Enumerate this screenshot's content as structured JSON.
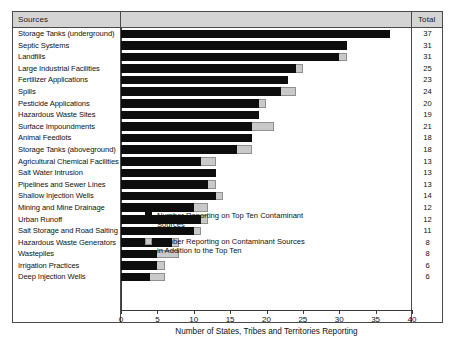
{
  "table": {
    "header": {
      "sources_label": "Sources",
      "total_label": "Total"
    }
  },
  "axis": {
    "title": "Number of States, Tribes and Territories Reporting",
    "ticks": [
      "0",
      "5",
      "10",
      "15",
      "20",
      "25",
      "30",
      "35",
      "40"
    ]
  },
  "legend": {
    "items": [
      {
        "label": "Number Reporting on Top Ten Contaminant Sources",
        "color": "#0d0d0d",
        "swatch": "primary"
      },
      {
        "label": "Number Reporting on Contaminant Sources in Addition to the Top Ten",
        "color": "#c9c9c9",
        "swatch": "secondary"
      }
    ]
  },
  "chart_data": {
    "type": "bar",
    "orientation": "horizontal",
    "stacked": true,
    "title": "",
    "xlabel": "Number of States, Tribes and Territories Reporting",
    "ylabel": "Sources",
    "xlim": [
      0,
      40
    ],
    "xticks": [
      0,
      5,
      10,
      15,
      20,
      25,
      30,
      35,
      40
    ],
    "grid": false,
    "legend_position": "inside-lower-center",
    "categories": [
      "Storage Tanks (underground)",
      "Septic Systems",
      "Landfills",
      "Large Industrial Facilities",
      "Fertilizer Applications",
      "Spills",
      "Pesticide Applications",
      "Hazardous Waste Sites",
      "Surface Impoundments",
      "Animal Feedlots",
      "Storage Tanks (aboveground)",
      "Agricultural Chemical Facilities",
      "Salt Water Intrusion",
      "Pipelines and Sewer Lines",
      "Shallow Injection Wells",
      "Mining and Mine Drainage",
      "Urban Runoff",
      "Salt Storage and Road Salting",
      "Hazardous Waste Generators",
      "Wastepiles",
      "Irrigation Practices",
      "Deep Injection Wells"
    ],
    "series": [
      {
        "name": "Number Reporting on Top Ten Contaminant Sources",
        "color": "#0d0d0d",
        "values": [
          37,
          31,
          30,
          24,
          23,
          22,
          19,
          19,
          18,
          18,
          16,
          11,
          13,
          12,
          13,
          10,
          11,
          10,
          7,
          5,
          5,
          4
        ]
      },
      {
        "name": "Number Reporting on Contaminant Sources in Addition to the Top Ten",
        "color": "#c9c9c9",
        "values": [
          0,
          0,
          1,
          1,
          0,
          2,
          1,
          0,
          3,
          0,
          2,
          2,
          0,
          1,
          1,
          2,
          1,
          1,
          1,
          3,
          1,
          2
        ]
      }
    ],
    "totals": [
      37,
      31,
      31,
      25,
      23,
      24,
      20,
      19,
      21,
      18,
      18,
      13,
      13,
      13,
      14,
      12,
      12,
      11,
      8,
      8,
      6,
      6
    ]
  }
}
